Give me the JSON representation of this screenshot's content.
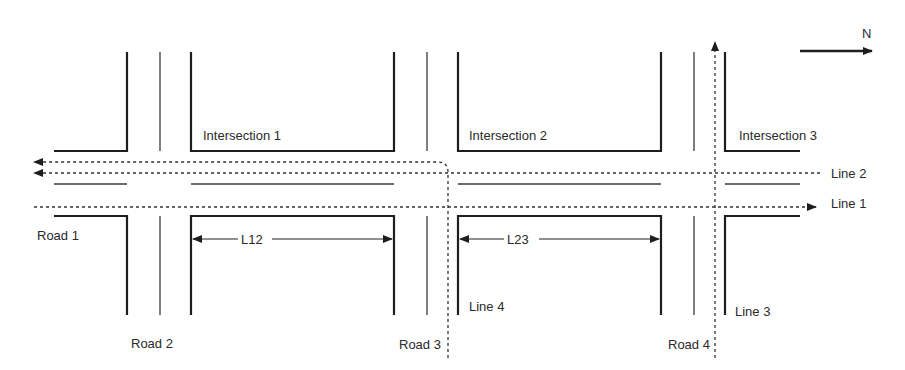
{
  "diagram": {
    "type": "road-network",
    "compass": {
      "label": "N",
      "direction": "east"
    },
    "intersections": [
      {
        "label": "Intersection 1"
      },
      {
        "label": "Intersection 2"
      },
      {
        "label": "Intersection 3"
      }
    ],
    "roads": [
      {
        "label": "Road 1"
      },
      {
        "label": "Road 2"
      },
      {
        "label": "Road 3"
      },
      {
        "label": "Road 4"
      }
    ],
    "lines": [
      {
        "label": "Line 1"
      },
      {
        "label": "Line 2"
      },
      {
        "label": "Line 3"
      },
      {
        "label": "Line 4"
      }
    ],
    "dimensions": [
      {
        "label": "L12"
      },
      {
        "label": "L23"
      }
    ],
    "colors": {
      "stroke": "#1e1e1e",
      "text": "#2a2a2a",
      "background": "#ffffff"
    }
  }
}
